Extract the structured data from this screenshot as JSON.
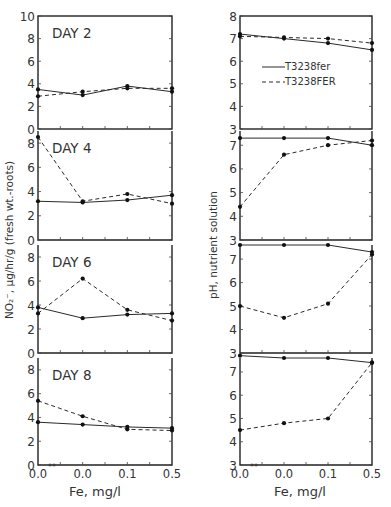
{
  "figure": {
    "left_ylabel": "NO₂⁻, μg/hr/g (fresh wt.-roots)",
    "right_ylabel": "pH, nutrient solution",
    "xlabel": "Fe, mg/l",
    "x_tick_labels": [
      "0.0",
      "0.0",
      "0.1",
      "0.5"
    ],
    "x_tick_marks": "**",
    "legend": {
      "solid": "T3238fer",
      "dashed": "T3238FER"
    },
    "colors": {
      "line": "#2a2a2a",
      "frame": "#222222",
      "background": "#ffffff"
    }
  },
  "chart_data": [
    {
      "type": "line",
      "title": "DAY 2",
      "panel": "left-1",
      "xlabel": "Fe, mg/l",
      "ylabel": "NO2-, μg/hr/g (fresh wt.-roots)",
      "categories": [
        "0.0**",
        "0.0",
        "0.1",
        "0.5"
      ],
      "ylim": [
        0,
        10
      ],
      "yticks": [
        0,
        2,
        4,
        6,
        8,
        10
      ],
      "series": [
        {
          "name": "T3238fer",
          "style": "solid",
          "values": [
            3.5,
            3.0,
            3.8,
            3.3
          ]
        },
        {
          "name": "T3238FER",
          "style": "dashed",
          "values": [
            2.9,
            3.3,
            3.6,
            3.6
          ]
        }
      ]
    },
    {
      "type": "line",
      "title": "DAY 4",
      "panel": "left-2",
      "categories": [
        "0.0**",
        "0.0",
        "0.1",
        "0.5"
      ],
      "ylim": [
        0,
        9
      ],
      "yticks": [
        0,
        2,
        4,
        6,
        8
      ],
      "series": [
        {
          "name": "T3238fer",
          "style": "solid",
          "values": [
            3.2,
            3.1,
            3.3,
            3.7
          ]
        },
        {
          "name": "T3238FER",
          "style": "dashed",
          "values": [
            8.5,
            3.2,
            3.8,
            3.0
          ]
        }
      ]
    },
    {
      "type": "line",
      "title": "DAY 6",
      "panel": "left-3",
      "categories": [
        "0.0**",
        "0.0",
        "0.1",
        "0.5"
      ],
      "ylim": [
        0,
        9
      ],
      "yticks": [
        0,
        2,
        4,
        6,
        8
      ],
      "series": [
        {
          "name": "T3238fer",
          "style": "solid",
          "values": [
            3.8,
            2.9,
            3.2,
            3.3
          ]
        },
        {
          "name": "T3238FER",
          "style": "dashed",
          "values": [
            3.3,
            6.2,
            3.6,
            2.7
          ]
        }
      ]
    },
    {
      "type": "line",
      "title": "DAY 8",
      "panel": "left-4",
      "categories": [
        "0.0**",
        "0.0",
        "0.1",
        "0.5"
      ],
      "ylim": [
        0,
        9
      ],
      "yticks": [
        0,
        2,
        4,
        6,
        8
      ],
      "series": [
        {
          "name": "T3238fer",
          "style": "solid",
          "values": [
            3.6,
            3.4,
            3.2,
            3.1
          ]
        },
        {
          "name": "T3238FER",
          "style": "dashed",
          "values": [
            5.4,
            4.1,
            3.0,
            2.9
          ]
        }
      ]
    },
    {
      "type": "line",
      "title": "pH DAY 2",
      "panel": "right-1",
      "ylabel": "pH, nutrient solution",
      "categories": [
        "0.0**",
        "0.0",
        "0.1",
        "0.5"
      ],
      "ylim": [
        3,
        8
      ],
      "yticks": [
        3,
        4,
        5,
        6,
        7,
        8
      ],
      "series": [
        {
          "name": "T3238fer",
          "style": "solid",
          "values": [
            7.2,
            7.0,
            6.8,
            6.5
          ]
        },
        {
          "name": "T3238FER",
          "style": "dashed",
          "values": [
            7.1,
            7.05,
            7.0,
            6.8
          ]
        }
      ]
    },
    {
      "type": "line",
      "title": "pH DAY 4",
      "panel": "right-2",
      "categories": [
        "0.0**",
        "0.0",
        "0.1",
        "0.5"
      ],
      "ylim": [
        3,
        7.6
      ],
      "yticks": [
        3,
        4,
        5,
        6,
        7
      ],
      "series": [
        {
          "name": "T3238fer",
          "style": "solid",
          "values": [
            7.3,
            7.3,
            7.3,
            7.0
          ]
        },
        {
          "name": "T3238FER",
          "style": "dashed",
          "values": [
            4.4,
            6.6,
            7.0,
            7.2
          ]
        }
      ]
    },
    {
      "type": "line",
      "title": "pH DAY 6",
      "panel": "right-3",
      "categories": [
        "0.0**",
        "0.0",
        "0.1",
        "0.5"
      ],
      "ylim": [
        3,
        7.6
      ],
      "yticks": [
        3,
        4,
        5,
        6,
        7
      ],
      "series": [
        {
          "name": "T3238fer",
          "style": "solid",
          "values": [
            7.6,
            7.6,
            7.6,
            7.3
          ]
        },
        {
          "name": "T3238FER",
          "style": "dashed",
          "values": [
            5.0,
            4.5,
            5.1,
            7.2
          ]
        }
      ]
    },
    {
      "type": "line",
      "title": "pH DAY 8",
      "panel": "right-4",
      "categories": [
        "0.0**",
        "0.0",
        "0.1",
        "0.5"
      ],
      "ylim": [
        3,
        7.6
      ],
      "yticks": [
        3,
        4,
        5,
        6,
        7
      ],
      "series": [
        {
          "name": "T3238fer",
          "style": "solid",
          "values": [
            7.7,
            7.6,
            7.6,
            7.4
          ]
        },
        {
          "name": "T3238FER",
          "style": "dashed",
          "values": [
            4.5,
            4.8,
            5.0,
            7.4
          ]
        }
      ]
    }
  ]
}
